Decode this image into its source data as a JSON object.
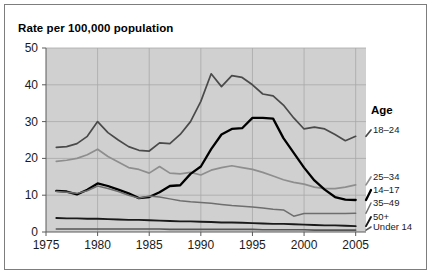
{
  "figure": {
    "title": "Rate per 100,000 population",
    "legend_title": "Age"
  },
  "axes": {
    "yticks": [
      "0",
      "10",
      "20",
      "30",
      "40",
      "50"
    ],
    "xticks": [
      "1975",
      "1980",
      "1985",
      "1990",
      "1995",
      "2000",
      "2005"
    ]
  },
  "legend": {
    "items": [
      {
        "label": "18–24"
      },
      {
        "label": "25–34"
      },
      {
        "label": "14–17"
      },
      {
        "label": "35–49"
      },
      {
        "label": "50+"
      },
      {
        "label": "Under 14"
      }
    ]
  },
  "colors": {
    "plot_background": "#d0d0d0",
    "grid": "#a8a8a8",
    "axis": "#5a5a5a",
    "series_18_24": "#4a4a4a",
    "series_25_34": "#8e8e8e",
    "series_14_17": "#000000",
    "series_35_49": "#6e6e6e",
    "series_50_plus": "#1a1a1a",
    "series_under_14": "#555555"
  },
  "chart_data": {
    "type": "line",
    "title": "Rate per 100,000 population",
    "xlabel": "",
    "ylabel": "Rate per 100,000 population",
    "xlim": [
      1975,
      2006
    ],
    "ylim": [
      0,
      50
    ],
    "grid": true,
    "legend_position": "right",
    "x": [
      1976,
      1977,
      1978,
      1979,
      1980,
      1981,
      1982,
      1983,
      1984,
      1985,
      1986,
      1987,
      1988,
      1989,
      1990,
      1991,
      1992,
      1993,
      1994,
      1995,
      1996,
      1997,
      1998,
      1999,
      2000,
      2001,
      2002,
      2003,
      2004,
      2005
    ],
    "series": [
      {
        "name": "18–24",
        "values": [
          23.0,
          23.2,
          24.0,
          26.0,
          30.0,
          27.0,
          25.0,
          23.2,
          22.2,
          22.0,
          24.2,
          24.0,
          26.5,
          30.0,
          35.5,
          43.0,
          39.5,
          42.5,
          42.0,
          40.0,
          37.5,
          37.0,
          34.5,
          31.0,
          28.0,
          28.5,
          28.0,
          26.5,
          24.8,
          26.0
        ]
      },
      {
        "name": "25–34",
        "values": [
          19.2,
          19.5,
          20.0,
          21.0,
          22.5,
          20.5,
          19.0,
          17.5,
          17.0,
          16.0,
          17.8,
          16.0,
          15.8,
          16.2,
          15.5,
          16.8,
          17.5,
          18.0,
          17.5,
          17.0,
          16.2,
          15.2,
          14.2,
          13.5,
          13.0,
          12.2,
          11.8,
          11.8,
          12.2,
          12.8
        ]
      },
      {
        "name": "14–17",
        "values": [
          11.2,
          11.0,
          10.2,
          11.5,
          13.2,
          12.5,
          11.5,
          10.5,
          9.2,
          9.5,
          10.8,
          12.5,
          12.7,
          15.8,
          17.8,
          22.5,
          26.5,
          28.0,
          28.2,
          31.0,
          31.0,
          30.8,
          25.5,
          21.5,
          17.5,
          14.0,
          11.5,
          9.5,
          8.8,
          8.7
        ]
      },
      {
        "name": "35–49",
        "values": [
          11.0,
          10.8,
          10.5,
          11.2,
          12.5,
          11.8,
          11.0,
          10.0,
          9.2,
          9.8,
          9.5,
          9.0,
          8.5,
          8.2,
          8.0,
          7.8,
          7.5,
          7.2,
          7.0,
          6.8,
          6.5,
          6.2,
          6.0,
          4.3,
          5.0,
          5.0,
          5.0,
          5.0,
          5.0,
          5.1
        ]
      },
      {
        "name": "50+",
        "values": [
          3.8,
          3.7,
          3.7,
          3.6,
          3.6,
          3.5,
          3.4,
          3.3,
          3.3,
          3.2,
          3.1,
          3.0,
          2.9,
          2.9,
          2.8,
          2.7,
          2.6,
          2.6,
          2.5,
          2.4,
          2.3,
          2.2,
          2.2,
          2.1,
          2.0,
          1.9,
          1.8,
          1.8,
          1.7,
          1.6
        ]
      },
      {
        "name": "Under 14",
        "values": [
          0.8,
          0.8,
          0.8,
          0.8,
          0.8,
          0.8,
          0.8,
          0.8,
          0.8,
          0.8,
          0.8,
          0.7,
          0.7,
          0.7,
          0.7,
          0.7,
          0.7,
          0.7,
          0.7,
          0.7,
          0.6,
          0.6,
          0.6,
          0.6,
          0.6,
          0.5,
          0.5,
          0.5,
          0.5,
          0.5
        ]
      }
    ]
  }
}
